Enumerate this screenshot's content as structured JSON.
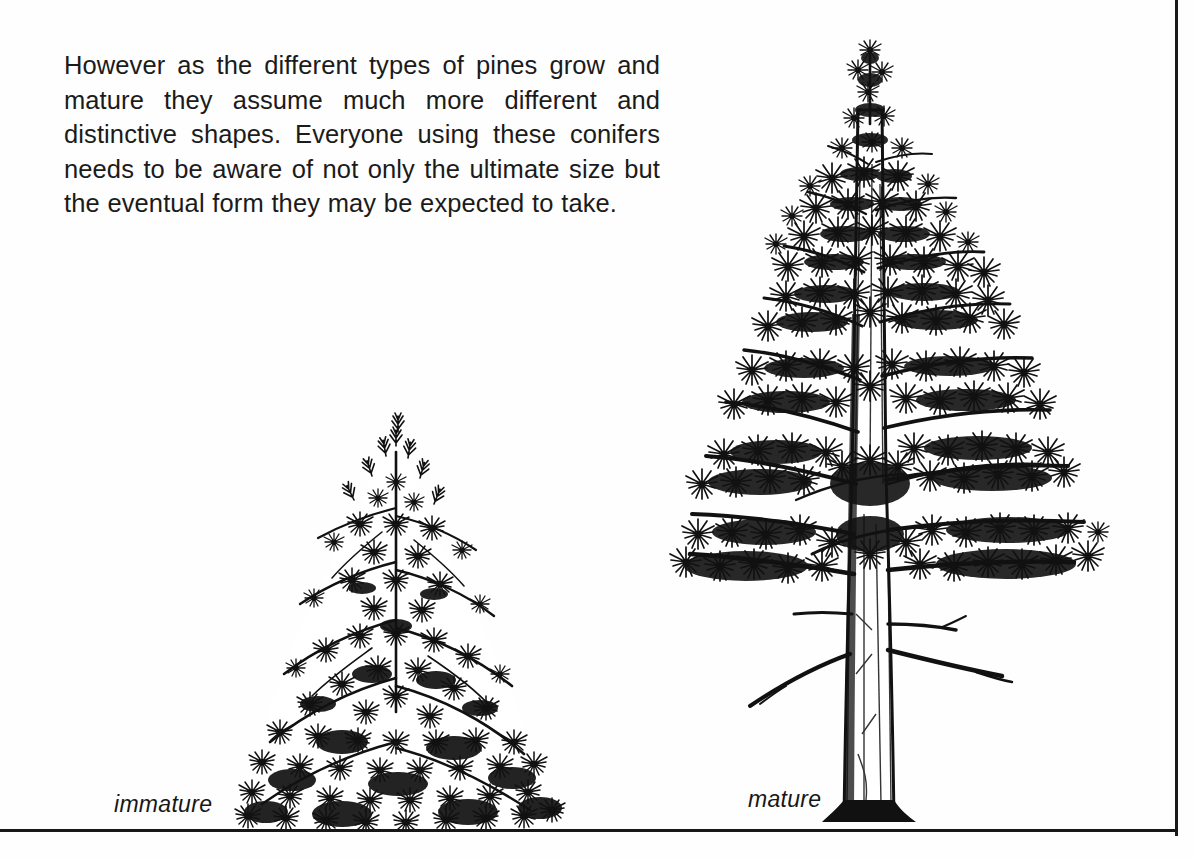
{
  "page": {
    "background_color": "#fefefe",
    "ink_color": "#1b1b1b",
    "rule_color": "#171717"
  },
  "body": {
    "paragraph": "However as the different types of pines grow and mature they assume much more different and distinctive shapes. Everyone using these conifers needs to be aware of not only the ultimate size but the eventual form they may be expected to take."
  },
  "figures": {
    "immature": {
      "caption": "immature",
      "icon": "pine-tree-immature-illustration",
      "description": "Dense bushy conical young pine, foliage to the ground, no visible trunk"
    },
    "mature": {
      "caption": "mature",
      "icon": "pine-tree-mature-illustration",
      "description": "Tall open-crowned mature pine with bare lower trunk and tiered horizontal branches"
    }
  },
  "rules": {
    "right_border": "vertical-page-rule",
    "bottom_border": "horizontal-page-rule"
  }
}
